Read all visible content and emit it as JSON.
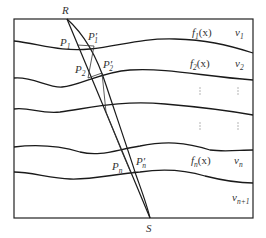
{
  "diagram": {
    "points": {
      "source": "R",
      "receiver": "S"
    },
    "intersections": {
      "p1": "P",
      "p1_sub": "1",
      "p1_prime": "P′",
      "p1_prime_sub": "1",
      "p2": "P",
      "p2_sub": "2",
      "p2_prime": "P′",
      "p2_prime_sub": "2",
      "pn": "P",
      "pn_sub": "n",
      "pn_prime": "P′",
      "pn_prime_sub": "n"
    },
    "interfaces": [
      {
        "func": "f",
        "sub": "1",
        "arg": "(x)"
      },
      {
        "func": "f",
        "sub": "2",
        "arg": "(x)"
      },
      {
        "func": "f",
        "sub": "n",
        "arg": "(x)"
      }
    ],
    "velocities": [
      {
        "sym": "v",
        "sub": "1"
      },
      {
        "sym": "v",
        "sub": "2"
      },
      {
        "sym": "v",
        "sub": "n"
      },
      {
        "sym": "v",
        "sub": "n+1"
      }
    ],
    "ellipsis": "⋮"
  }
}
